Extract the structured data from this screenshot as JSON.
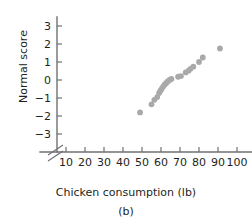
{
  "figure": {
    "caption": "(b)",
    "point_color": "#a9a9a9",
    "axis_color": "#6e7173"
  },
  "chart_data": {
    "type": "scatter",
    "title": "",
    "xlabel": "Chicken consumption (lb)",
    "ylabel": "Normal score",
    "xlim": [
      0,
      105
    ],
    "ylim": [
      -3.6,
      3.4
    ],
    "grid": false,
    "legend": null,
    "y_axis_break": true,
    "y_axis_break_below": -3,
    "xticks": [
      10,
      20,
      30,
      40,
      50,
      60,
      70,
      80,
      90,
      100
    ],
    "xticklabels": [
      "10",
      "20",
      "30",
      "40",
      "50",
      "60",
      "70",
      "80",
      "90",
      "100"
    ],
    "yticks": [
      -3,
      -2,
      -1,
      0,
      1,
      2,
      3
    ],
    "yticklabels": [
      "-3",
      "-2",
      "-1",
      "0",
      "1",
      "2",
      "3"
    ],
    "x": [
      49.0,
      55.0,
      56.5,
      58.0,
      59.0,
      59.8,
      60.5,
      61.2,
      62.0,
      62.8,
      63.5,
      64.5,
      65.5,
      69.0,
      70.5,
      73.0,
      74.5,
      75.5,
      77.0,
      80.0,
      82.0,
      91.0
    ],
    "y": [
      -1.8,
      -1.35,
      -1.1,
      -0.95,
      -0.72,
      -0.58,
      -0.46,
      -0.35,
      -0.25,
      -0.16,
      -0.08,
      0.0,
      0.06,
      0.18,
      0.22,
      0.42,
      0.52,
      0.62,
      0.74,
      1.0,
      1.25,
      1.75
    ]
  }
}
